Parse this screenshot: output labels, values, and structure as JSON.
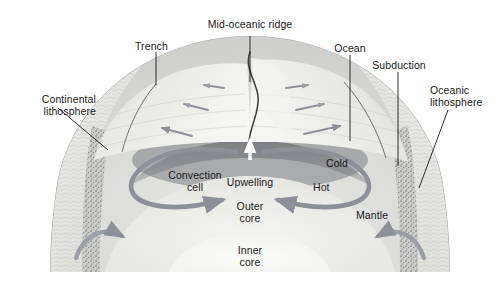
{
  "diagram": {
    "background_color": "#ffffff",
    "ink_color": "#1a1a1a",
    "arrow_color": "#8d9097",
    "crust_stipple_color": "#8a8d93"
  },
  "labels": {
    "trench": "Trench",
    "mid_oceanic_ridge": "Mid-oceanic ridge",
    "ocean": "Ocean",
    "subduction": "Subduction",
    "oceanic_lithosphere": "Oceanic\nlithosphere",
    "continental_lithosphere": "Continental\nlithosphere",
    "convection_cell": "Convection\ncell",
    "upwelling": "Upwelling",
    "cold": "Cold",
    "hot": "Hot",
    "mantle": "Mantle",
    "outer_core": "Outer\ncore",
    "inner_core": "Inner\ncore"
  },
  "structures": [
    {
      "name": "continental-lithosphere-left",
      "kind": "crust",
      "side": "left"
    },
    {
      "name": "continental-lithosphere-right",
      "kind": "crust",
      "side": "right"
    },
    {
      "name": "oceanic-plate-left",
      "kind": "plate",
      "motion": "left"
    },
    {
      "name": "oceanic-plate-right",
      "kind": "plate",
      "motion": "right"
    },
    {
      "name": "mid-oceanic-ridge",
      "kind": "spreading-center"
    },
    {
      "name": "mantle",
      "kind": "layer"
    },
    {
      "name": "outer-core",
      "kind": "layer"
    },
    {
      "name": "inner-core",
      "kind": "layer"
    }
  ],
  "flow_arrows": {
    "seafloor_left_count": 3,
    "seafloor_right_count": 3,
    "upwelling_direction": "up",
    "convection_left_direction": "counter-clockwise",
    "convection_right_direction": "clockwise",
    "deep_arrows_count": 2
  }
}
